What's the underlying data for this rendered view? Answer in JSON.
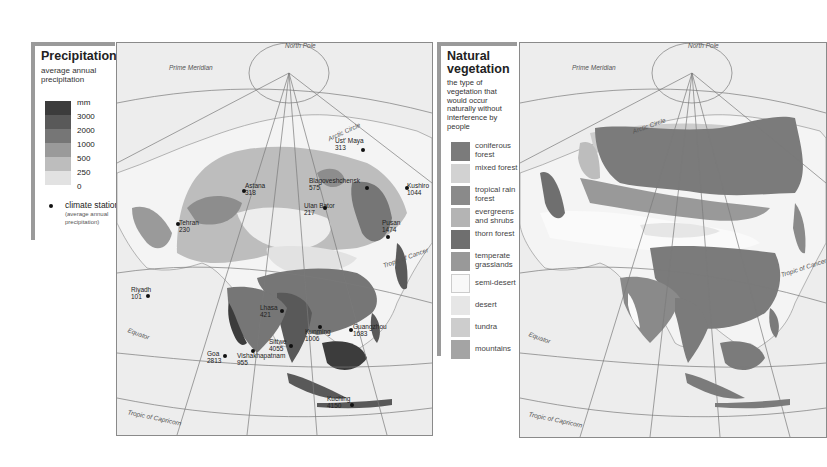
{
  "precipitation_legend": {
    "title": "Precipitation",
    "subtitle": "average annual precipitation",
    "unit": "mm",
    "scale": [
      {
        "label": "3000",
        "color": "#3c3c3c"
      },
      {
        "label": "2000",
        "color": "#595959"
      },
      {
        "label": "1000",
        "color": "#767676"
      },
      {
        "label": "500",
        "color": "#9a9a9a"
      },
      {
        "label": "250",
        "color": "#bdbdbd"
      },
      {
        "label": "0",
        "color": "#e2e2e2"
      }
    ],
    "station_label": "climate station",
    "station_note": "(average annual precipitation)"
  },
  "vegetation_legend": {
    "title": "Natural vegetation",
    "subtitle": "the type of vegetation that would occur naturally without interference by people",
    "items": [
      {
        "label": "coniferous forest",
        "color": "#7b7b7b"
      },
      {
        "label": "mixed forest",
        "color": "#d2d2d2"
      },
      {
        "label": "tropical rain forest",
        "color": "#8a8a8a"
      },
      {
        "label": "evergreens and shrubs",
        "color": "#b4b4b4"
      },
      {
        "label": "thorn forest",
        "color": "#6f6f6f"
      },
      {
        "label": "temperate grasslands",
        "color": "#999999"
      },
      {
        "label": "semi-desert",
        "color": "#f8f8f8"
      },
      {
        "label": "desert",
        "color": "#e6e6e6"
      },
      {
        "label": "tundra",
        "color": "#cdcdcd"
      },
      {
        "label": "mountains",
        "color": "#a4a4a4"
      }
    ]
  },
  "map_grid_labels": {
    "north_pole": "North Pole",
    "prime_meridian": "Prime Meridian",
    "arctic_circle": "Arctic Circle",
    "tropic_cancer": "Tropic of Cancer",
    "equator": "Equator",
    "tropic_capricorn": "Tropic of Capricorn"
  },
  "climate_stations": [
    {
      "name": "Ust' Maya",
      "value": "313"
    },
    {
      "name": "Astana",
      "value": "318"
    },
    {
      "name": "Blagoveshchensk",
      "value": "575"
    },
    {
      "name": "Kushiro",
      "value": "1044"
    },
    {
      "name": "Ulan Bator",
      "value": "217"
    },
    {
      "name": "Tehran",
      "value": "230"
    },
    {
      "name": "Pusan",
      "value": "1474"
    },
    {
      "name": "Riyadh",
      "value": "101"
    },
    {
      "name": "Lhasa",
      "value": "421"
    },
    {
      "name": "Kunming",
      "value": "1006"
    },
    {
      "name": "Guangzhou",
      "value": "1683"
    },
    {
      "name": "Sittwe",
      "value": "4055"
    },
    {
      "name": "Goa",
      "value": "2813"
    },
    {
      "name": "Vishakhapatnam",
      "value": "955"
    },
    {
      "name": "Kuching",
      "value": "4150"
    }
  ]
}
